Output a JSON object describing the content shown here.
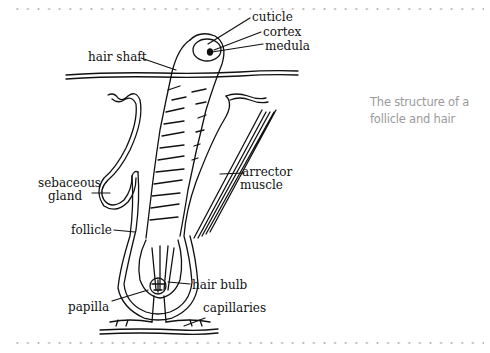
{
  "caption": {
    "line1": "The structure of a",
    "line2": "follicle and hair"
  },
  "labels": {
    "cuticle": "cuticle",
    "cortex": "cortex",
    "medula": "medula",
    "hair_shaft": "hair shaft",
    "sebaceous_line1": "sebaceous",
    "sebaceous_line2": "gland",
    "arrector_line1": "arrector",
    "arrector_line2": "muscle",
    "follicle": "follicle",
    "hair_bulb": "hair bulb",
    "papilla": "papilla",
    "capillaries": "capillaries"
  },
  "colors": {
    "ink": "#111111",
    "caption": "#9a9a9a",
    "dots": "#b5b5b5"
  }
}
